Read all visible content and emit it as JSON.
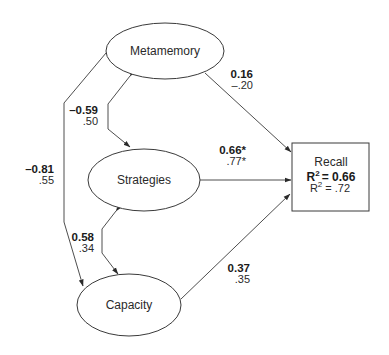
{
  "diagram": {
    "type": "path-model",
    "nodes": {
      "metamemory": {
        "label": "Metamemory",
        "shape": "ellipse"
      },
      "strategies": {
        "label": "Strategies",
        "shape": "ellipse"
      },
      "capacity": {
        "label": "Capacity",
        "shape": "ellipse"
      },
      "recall": {
        "label": "Recall",
        "shape": "rectangle",
        "r2_primary_prefix": "R",
        "r2_primary_sup": "2",
        "r2_primary_value": "= 0.66",
        "r2_secondary_prefix": "R",
        "r2_secondary_sup": "2",
        "r2_secondary_value": " = .72"
      }
    },
    "edges": {
      "metamemory_recall": {
        "from": "Metamemory",
        "to": "Recall",
        "primary": "0.16",
        "secondary": "–.20"
      },
      "strategies_recall": {
        "from": "Strategies",
        "to": "Recall",
        "primary": "0.66*",
        "secondary": ".77*"
      },
      "capacity_recall": {
        "from": "Capacity",
        "to": "Recall",
        "primary": "0.37",
        "secondary": ".35"
      },
      "metamemory_strategies": {
        "from": "Metamemory",
        "to": "Strategies",
        "type": "correlation",
        "primary": "–0.59",
        "secondary": ".50"
      },
      "strategies_capacity": {
        "from": "Strategies",
        "to": "Capacity",
        "type": "correlation",
        "primary": "0.58",
        "secondary": ".34"
      },
      "metamemory_capacity": {
        "from": "Metamemory",
        "to": "Capacity",
        "type": "correlation",
        "primary": "–0.81",
        "secondary": ".55"
      }
    },
    "colors": {
      "stroke": "#3a3a3a",
      "text": "#1a1a1a",
      "background": "#ffffff"
    }
  }
}
